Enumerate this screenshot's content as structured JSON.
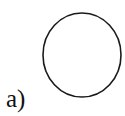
{
  "figure": {
    "panel_label": "a)",
    "shape": {
      "type": "circle",
      "cx": 82,
      "cy": 55,
      "rx": 39,
      "ry": 42,
      "stroke": "#1a1a1a",
      "fill": "#ffffff",
      "stroke_width": 1.6
    }
  }
}
